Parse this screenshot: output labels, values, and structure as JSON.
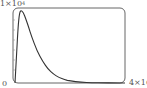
{
  "chart_data": {
    "type": "line",
    "title": "",
    "xlabel": "",
    "ylabel": "",
    "x_tick_labels": [
      "0",
      "4×10"
    ],
    "y_tick_labels": [
      "1×10"
    ],
    "y_top_label": "1×10",
    "y_top_exponent": "",
    "x_max_label": "4×10",
    "x_max_exponent": "",
    "x_min_label": "0",
    "grid": false,
    "legend": null,
    "xlim": [
      0,
      4
    ],
    "ylim": [
      0,
      1
    ],
    "series": [
      {
        "name": "curve",
        "color": "#333333",
        "x": [
          0,
          0.05,
          0.1,
          0.15,
          0.2,
          0.3,
          0.4,
          0.5,
          0.6,
          0.8,
          1.0,
          1.2,
          1.4,
          1.6,
          1.8,
          2.0,
          2.4,
          2.8,
          3.2,
          3.6,
          4.0
        ],
        "y": [
          0,
          0.35,
          0.7,
          0.92,
          1.0,
          0.97,
          0.87,
          0.76,
          0.64,
          0.44,
          0.3,
          0.19,
          0.12,
          0.075,
          0.045,
          0.027,
          0.01,
          0.004,
          0.0015,
          0.0005,
          0.0002
        ]
      }
    ]
  },
  "labels": {
    "y_top": "1×10",
    "x_zero": "0",
    "x_max": "4×10"
  },
  "style": {
    "frame_color": "#555555",
    "curve_color": "#333333"
  }
}
